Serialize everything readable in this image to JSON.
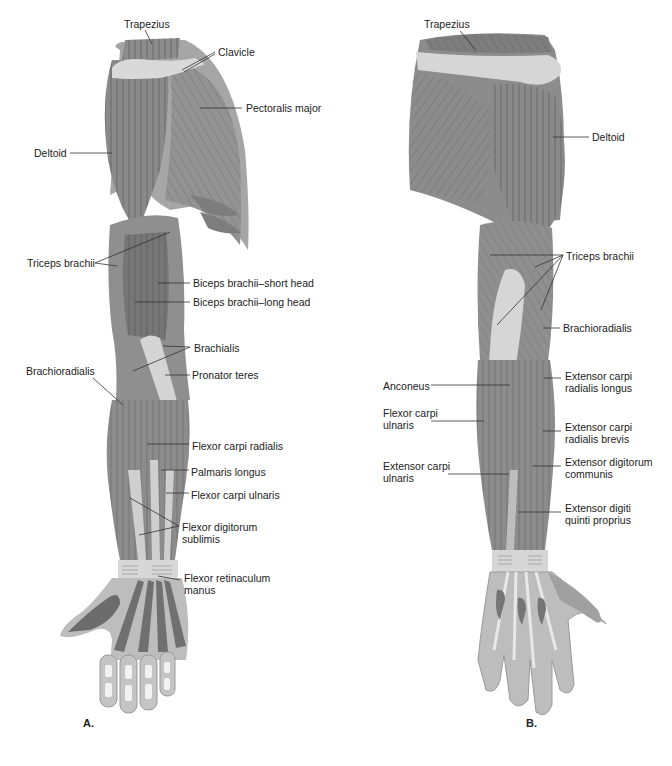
{
  "figure": {
    "panels": [
      {
        "id": "A",
        "letter": "A.",
        "view": "anterior",
        "letter_pos": [
          83,
          717
        ],
        "labels": [
          {
            "text": "Trapezius",
            "x": 124,
            "y": 18,
            "lines": [
              [
                145,
                30,
                152,
                44
              ]
            ]
          },
          {
            "text": "Clavicle",
            "x": 218,
            "y": 46,
            "lines": [
              [
                215,
                52,
                182,
                70
              ],
              [
                215,
                54,
                184,
                72
              ]
            ]
          },
          {
            "text": "Pectoralis major",
            "x": 246,
            "y": 102,
            "lines": [
              [
                242,
                108,
                200,
                108
              ]
            ]
          },
          {
            "text": "Deltoid",
            "x": 34,
            "y": 147,
            "lines": [
              [
                70,
                153,
                112,
                153
              ]
            ]
          },
          {
            "text": "Triceps brachii",
            "x": 27,
            "y": 257,
            "lines": [
              [
                95,
                263,
                170,
                232
              ],
              [
                95,
                263,
                117,
                266
              ]
            ]
          },
          {
            "text": "Biceps brachii–short head",
            "x": 193,
            "y": 277,
            "lines": [
              [
                190,
                283,
                158,
                283
              ]
            ]
          },
          {
            "text": "Biceps brachii–long head",
            "x": 193,
            "y": 296,
            "lines": [
              [
                190,
                302,
                135,
                302
              ]
            ]
          },
          {
            "text": "Brachialis",
            "x": 194,
            "y": 342,
            "lines": [
              [
                190,
                347,
                163,
                346
              ],
              [
                190,
                347,
                133,
                371
              ]
            ]
          },
          {
            "text": "Pronator teres",
            "x": 192,
            "y": 369,
            "lines": [
              [
                190,
                375,
                165,
                375
              ]
            ]
          },
          {
            "text": "Brachioradialis",
            "x": 26,
            "y": 365,
            "lines": [
              [
                93,
                378,
                123,
                405
              ]
            ]
          },
          {
            "text": "Flexor carpi radialis",
            "x": 192,
            "y": 440,
            "lines": [
              [
                189,
                444,
                147,
                444
              ]
            ]
          },
          {
            "text": "Palmaris longus",
            "x": 191,
            "y": 466,
            "lines": [
              [
                189,
                470,
                161,
                470
              ]
            ]
          },
          {
            "text": "Flexor carpi ulnaris",
            "x": 191,
            "y": 489,
            "lines": [
              [
                189,
                493,
                166,
                493
              ]
            ]
          },
          {
            "text": "Flexor digitorum\nsublimis",
            "x": 182,
            "y": 521,
            "lines": [
              [
                179,
                526,
                130,
                498
              ],
              [
                179,
                526,
                139,
                535
              ]
            ]
          },
          {
            "text": "Flexor retinaculum\nmanus",
            "x": 184,
            "y": 572,
            "lines": [
              [
                180,
                580,
                158,
                576
              ]
            ]
          }
        ]
      },
      {
        "id": "B",
        "letter": "B.",
        "view": "posterior",
        "letter_pos": [
          526,
          717
        ],
        "labels": [
          {
            "text": "Trapezius",
            "x": 424,
            "y": 18,
            "lines": [
              [
                460,
                31,
                476,
                50
              ]
            ]
          },
          {
            "text": "Deltoid",
            "x": 592,
            "y": 131,
            "lines": [
              [
                589,
                137,
                553,
                137
              ]
            ]
          },
          {
            "text": "Triceps brachii",
            "x": 566,
            "y": 250,
            "lines": [
              [
                563,
                255,
                490,
                255
              ],
              [
                563,
                255,
                535,
                267
              ],
              [
                563,
                255,
                497,
                325
              ],
              [
                563,
                255,
                541,
                310
              ]
            ]
          },
          {
            "text": "Brachioradialis",
            "x": 563,
            "y": 322,
            "lines": [
              [
                560,
                328,
                543,
                328
              ]
            ]
          },
          {
            "text": "Extensor carpi\nradialis longus",
            "x": 565,
            "y": 370,
            "lines": [
              [
                561,
                378,
                544,
                378
              ]
            ]
          },
          {
            "text": "Anconeus",
            "x": 383,
            "y": 380,
            "lines": [
              [
                431,
                385,
                510,
                385
              ]
            ]
          },
          {
            "text": "Flexor carpi\nulnaris",
            "x": 383,
            "y": 407,
            "lines": [
              [
                431,
                421,
                484,
                421
              ]
            ]
          },
          {
            "text": "Extensor carpi\nradialis brevis",
            "x": 565,
            "y": 421,
            "lines": [
              [
                561,
                431,
                543,
                431
              ]
            ]
          },
          {
            "text": "Extensor digitorum\ncommunis",
            "x": 565,
            "y": 456,
            "lines": [
              [
                561,
                466,
                533,
                466
              ]
            ]
          },
          {
            "text": "Extensor carpi\nulnaris",
            "x": 383,
            "y": 460,
            "lines": [
              [
                448,
                474,
                509,
                474
              ]
            ]
          },
          {
            "text": "Extensor digiti\nquinti proprius",
            "x": 565,
            "y": 502,
            "lines": [
              [
                561,
                512,
                518,
                512
              ]
            ]
          }
        ]
      }
    ]
  },
  "colors": {
    "muscle_dark": "#6e6e6e",
    "muscle_mid": "#8a8a8a",
    "muscle_light": "#a4a4a4",
    "tendon": "#d6d6d6",
    "skin_edge": "#b9b9b9",
    "fiber": "#3c3c3c",
    "leader": "#333333",
    "text": "#222222"
  }
}
